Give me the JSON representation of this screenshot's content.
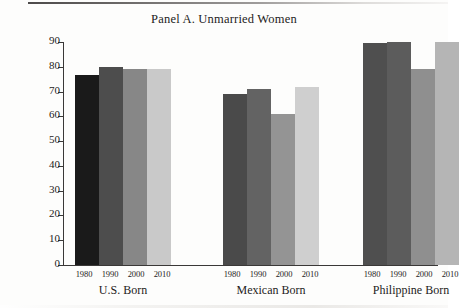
{
  "figure": {
    "title": "Panel A. Unmarried Women",
    "y_axis_title": "Percentages"
  },
  "chart_data": {
    "type": "bar",
    "title": "Panel A. Unmarried Women",
    "xlabel": "",
    "ylabel": "Percentages",
    "ylim": [
      0,
      90
    ],
    "yticks": [
      0,
      10,
      20,
      30,
      40,
      50,
      60,
      70,
      80,
      90
    ],
    "ytick_labels": [
      "0",
      "10",
      "20",
      "30",
      "40",
      "50",
      "60",
      "70",
      "80",
      "90"
    ],
    "grid": false,
    "legend": "none",
    "categories": [
      "U.S. Born",
      "Mexican Born",
      "Philippine Born"
    ],
    "sub_categories": [
      "1980",
      "1990",
      "2000",
      "2010"
    ],
    "series": [
      {
        "name": "1980",
        "color": "#1a1a1a",
        "values": [
          76.5,
          69.0,
          89.5
        ]
      },
      {
        "name": "1990",
        "color": "#4d4d4d",
        "values": [
          80.0,
          71.0,
          90.0
        ]
      },
      {
        "name": "2000",
        "color": "#878787",
        "values": [
          79.0,
          61.0,
          79.0
        ]
      },
      {
        "name": "2010",
        "color": "#c9c9c9",
        "values": [
          79.0,
          72.0,
          90.0
        ]
      }
    ],
    "groups": [
      {
        "label": "U.S. Born",
        "bars": [
          {
            "year": "1980",
            "value": 76.5,
            "color": "#1a1a1a"
          },
          {
            "year": "1990",
            "value": 80.0,
            "color": "#4d4d4d"
          },
          {
            "year": "2000",
            "value": 79.0,
            "color": "#878787"
          },
          {
            "year": "2010",
            "value": 79.0,
            "color": "#c9c9c9"
          }
        ]
      },
      {
        "label": "Mexican Born",
        "bars": [
          {
            "year": "1980",
            "value": 69.0,
            "color": "#4a4a4a"
          },
          {
            "year": "1990",
            "value": 71.0,
            "color": "#636363"
          },
          {
            "year": "2000",
            "value": 61.0,
            "color": "#949494"
          },
          {
            "year": "2010",
            "value": 72.0,
            "color": "#cfcfcf"
          }
        ]
      },
      {
        "label": "Philippine Born",
        "bars": [
          {
            "year": "1980",
            "value": 89.5,
            "color": "#4f4f4f"
          },
          {
            "year": "1990",
            "value": 90.0,
            "color": "#5c5c5c"
          },
          {
            "year": "2000",
            "value": 79.0,
            "color": "#8f8f8f"
          },
          {
            "year": "2010",
            "value": 90.0,
            "color": "#b5b5b5"
          }
        ]
      }
    ]
  },
  "layout": {
    "group_left_px": [
      12,
      160,
      300
    ],
    "plot_height_px": 223,
    "value_max": 90,
    "axis_color": "#3a3837"
  }
}
